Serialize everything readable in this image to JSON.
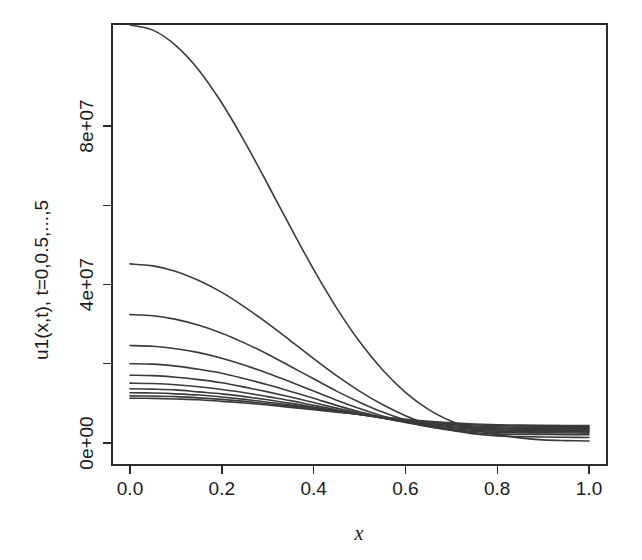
{
  "chart_data": {
    "type": "line",
    "title": "",
    "xlabel": "x",
    "ylabel": "u1(x,t), t=0,0.5,...,5",
    "xlim": [
      0.0,
      1.0
    ],
    "ylim": [
      -3500000,
      106000000
    ],
    "grid": false,
    "legend": "none",
    "xticks": [
      "0.0",
      "0.2",
      "0.4",
      "0.6",
      "0.8",
      "1.0"
    ],
    "xtick_values": [
      0.0,
      0.2,
      0.4,
      0.6,
      0.8,
      1.0
    ],
    "yticks": [
      "0e+00",
      "4e+07",
      "8e+07"
    ],
    "ytick_values": [
      0,
      40000000,
      80000000
    ],
    "yticks_minor_values": [
      20000000,
      60000000
    ],
    "x": [
      0.0,
      0.05,
      0.1,
      0.15,
      0.2,
      0.25,
      0.3,
      0.35,
      0.4,
      0.45,
      0.5,
      0.55,
      0.6,
      0.65,
      0.7,
      0.75,
      0.8,
      0.85,
      0.9,
      0.95,
      1.0
    ],
    "series": [
      {
        "name": "t=0",
        "values": [
          105500000,
          104200000,
          100300000,
          94100000,
          85800000,
          76000000,
          65300000,
          54400000,
          43800000,
          34100000,
          25600000,
          18500000,
          12800000,
          8500000,
          5500000,
          3400000,
          2100000,
          1300000,
          800000,
          600000,
          500000
        ]
      },
      {
        "name": "t=0.5",
        "values": [
          45200000,
          44700000,
          43300000,
          41000000,
          38000000,
          34300000,
          30200000,
          25800000,
          21300000,
          17000000,
          13100000,
          9700000,
          6900000,
          4700000,
          3200000,
          2300000,
          1800000,
          1600000,
          1500000,
          1450000,
          1400000
        ]
      },
      {
        "name": "t=1",
        "values": [
          32400000,
          32100000,
          31200000,
          29700000,
          27700000,
          25200000,
          22400000,
          19300000,
          16200000,
          13100000,
          10300000,
          7800000,
          5800000,
          4200000,
          3200000,
          2600000,
          2300000,
          2200000,
          2150000,
          2100000,
          2100000
        ]
      },
      {
        "name": "t=1.5",
        "values": [
          24600000,
          24400000,
          23800000,
          22800000,
          21400000,
          19600000,
          17600000,
          15400000,
          13100000,
          10800000,
          8700000,
          6800000,
          5300000,
          4100000,
          3400000,
          2900000,
          2700000,
          2600000,
          2550000,
          2520000,
          2500000
        ]
      },
      {
        "name": "t=2",
        "values": [
          20000000,
          19900000,
          19400000,
          18600000,
          17600000,
          16200000,
          14700000,
          13000000,
          11300000,
          9500000,
          7900000,
          6400000,
          5200000,
          4300000,
          3600000,
          3200000,
          3000000,
          2900000,
          2850000,
          2820000,
          2800000
        ]
      },
      {
        "name": "t=2.5",
        "values": [
          17100000,
          17000000,
          16600000,
          16000000,
          15200000,
          14100000,
          12900000,
          11600000,
          10200000,
          8800000,
          7500000,
          6300000,
          5300000,
          4500000,
          3900000,
          3500000,
          3300000,
          3200000,
          3150000,
          3120000,
          3100000
        ]
      },
      {
        "name": "t=3",
        "values": [
          15100000,
          15000000,
          14700000,
          14200000,
          13500000,
          12700000,
          11700000,
          10700000,
          9500000,
          8400000,
          7300000,
          6300000,
          5400000,
          4700000,
          4100000,
          3800000,
          3600000,
          3500000,
          3450000,
          3420000,
          3400000
        ]
      },
      {
        "name": "t=3.5",
        "values": [
          13700000,
          13600000,
          13400000,
          12900000,
          12400000,
          11700000,
          10900000,
          10000000,
          9100000,
          8100000,
          7200000,
          6300000,
          5500000,
          4900000,
          4400000,
          4000000,
          3800000,
          3700000,
          3650000,
          3620000,
          3600000
        ]
      },
      {
        "name": "t=4",
        "values": [
          12700000,
          12600000,
          12400000,
          12100000,
          11600000,
          11000000,
          10300000,
          9600000,
          8800000,
          8000000,
          7200000,
          6400000,
          5700000,
          5100000,
          4600000,
          4300000,
          4100000,
          4000000,
          3950000,
          3920000,
          3900000
        ]
      },
      {
        "name": "t=4.5",
        "values": [
          11900000,
          11850000,
          11700000,
          11400000,
          11000000,
          10500000,
          9900000,
          9300000,
          8600000,
          7900000,
          7200000,
          6500000,
          5900000,
          5300000,
          4900000,
          4600000,
          4400000,
          4300000,
          4250000,
          4220000,
          4200000
        ]
      },
      {
        "name": "t=5",
        "values": [
          11300000,
          11250000,
          11100000,
          10900000,
          10500000,
          10100000,
          9600000,
          9000000,
          8400000,
          7800000,
          7200000,
          6600000,
          6000000,
          5500000,
          5100000,
          4800000,
          4600000,
          4500000,
          4450000,
          4420000,
          4400000
        ]
      }
    ],
    "colors": {
      "line": "#3a3a3a",
      "axis": "#2b2b2b",
      "background": "#ffffff"
    }
  }
}
